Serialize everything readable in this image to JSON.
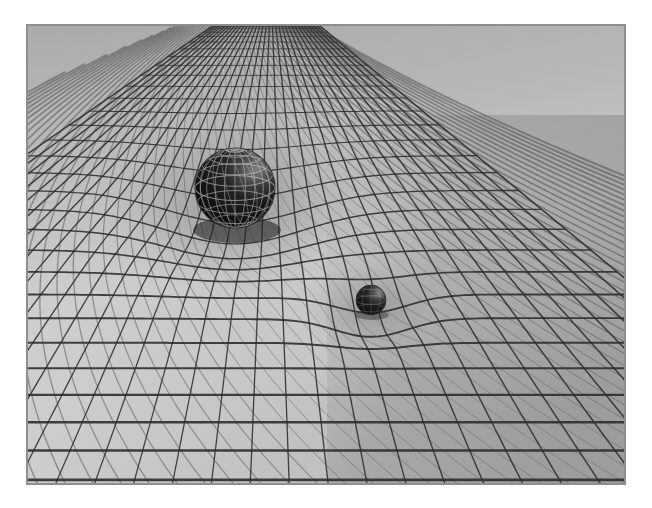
{
  "image": {
    "title": "Spacetime curvature illustration",
    "subject": "Warped grid mesh deformed by two masses (general relativity gravity well)",
    "style": "grayscale 3D wireframe render",
    "frame": {
      "x": 27,
      "y": 25,
      "width": 598,
      "height": 459
    },
    "canvas": {
      "width": 652,
      "height": 508
    },
    "background_color": "#ffffff",
    "surface_color_light": "#d2d2d2",
    "surface_color_mid": "#b0b0b0",
    "surface_color_dark": "#8a8a8a",
    "grid_line_color": "#2c2c2c",
    "grid_line_color_soft": "#5c5c5c"
  },
  "objects": [
    {
      "id": "large-sphere",
      "name": "wireframe-globe",
      "label": "Large wireframe globe",
      "center_x": 235,
      "center_y": 188,
      "radius": 40,
      "fill_color": "#141414",
      "wire_color": "#9a9a9a",
      "latitude_lines": 7,
      "longitude_lines": 12,
      "highlight": "upper-right specular sheen"
    },
    {
      "id": "small-sphere",
      "name": "small-solid-sphere",
      "label": "Small dark sphere",
      "center_x": 371,
      "center_y": 300,
      "radius": 15,
      "fill_color": "#151515",
      "wire_color": "#636363",
      "latitude_lines": 4,
      "longitude_lines": 5,
      "highlight": "upper-right specular sheen"
    }
  ],
  "surface": {
    "name": "deformed-spacetime-grid",
    "u_lines": 34,
    "v_lines": 30,
    "wells": [
      {
        "cx": 235,
        "cy": 200,
        "strength": 58,
        "sigma": 96,
        "source": "large-sphere"
      },
      {
        "cx": 371,
        "cy": 306,
        "strength": 26,
        "sigma": 52,
        "source": "small-sphere"
      }
    ],
    "horizon_y": 26,
    "perspective": "low camera angle looking across a receding plane"
  },
  "chart_data": {
    "type": "heatmap",
    "xlabel": "",
    "ylabel": "",
    "categories": [],
    "values": [],
    "series": []
  }
}
